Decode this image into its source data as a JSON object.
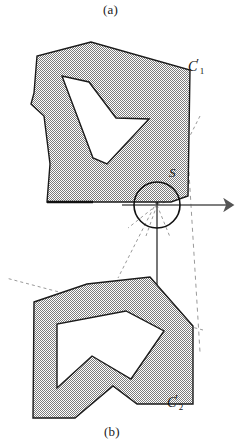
{
  "figure": {
    "captions": {
      "top": "(a)",
      "bottom": "(b)"
    },
    "labels": {
      "curve1_base": "C",
      "curve1_prime": "′",
      "curve1_sub": "1",
      "curve1_full": "C′1",
      "curve2_base": "C",
      "curve2_prime": "′",
      "curve2_sub": "2",
      "curve2_full": "C′2",
      "circle": "S"
    },
    "colors": {
      "stroke": "#1a1a1a",
      "fill_gray": "#b0b0b0",
      "axis": "#555555",
      "dashed": "#888888",
      "background": "#ffffff"
    },
    "geometry": {
      "circle_center_x": 157,
      "circle_center_y": 205,
      "circle_radius": 23,
      "axis_origin_x": 157,
      "axis_origin_y": 205,
      "x_axis_end": 232,
      "y_axis_top": 140,
      "y_axis_bottom": 290
    },
    "shapes": {
      "upper_outer": "91,42 37,56 34,93 31,104 44,116 50,164 47,202 171,202 188,196 190,70",
      "upper_inner": "62,76 93,158 107,164 149,119 116,118 89,82",
      "lower_outer": "34,302 87,284 150,277 193,326 193,404 137,404 113,386 75,418 33,418",
      "lower_inner": "57,324 57,388 92,356 131,379 164,331 126,311"
    }
  }
}
